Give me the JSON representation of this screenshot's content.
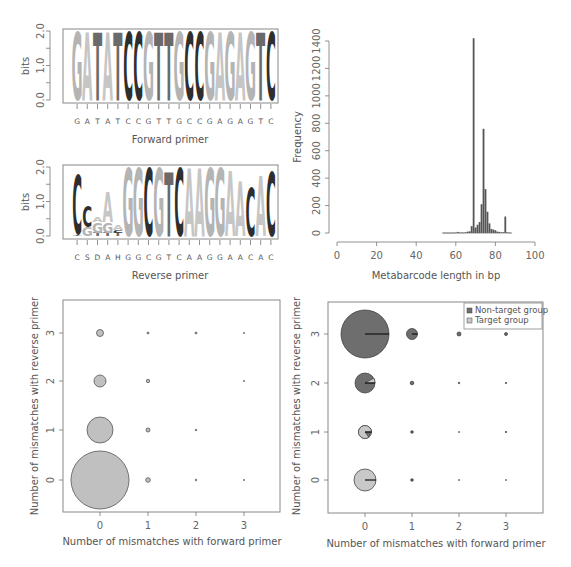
{
  "chart_data": [
    {
      "id": "forward-logo",
      "type": "sequence_logo",
      "ylabel": "bits",
      "xlabel": "Forward primer",
      "ylim": [
        0,
        2.0
      ],
      "yticks": [
        "0.0",
        "1.0",
        "2.0"
      ],
      "sequence": [
        "G",
        "A",
        "T",
        "A",
        "T",
        "C",
        "C",
        "G",
        "T",
        "T",
        "G",
        "C",
        "C",
        "G",
        "A",
        "G",
        "A",
        "G",
        "T",
        "C"
      ],
      "letter_heights": [
        1.95,
        1.95,
        1.95,
        1.95,
        1.95,
        1.95,
        1.95,
        1.95,
        1.95,
        1.95,
        1.95,
        1.95,
        1.95,
        1.95,
        1.95,
        1.95,
        1.95,
        1.95,
        1.95,
        1.95
      ]
    },
    {
      "id": "reverse-logo",
      "type": "sequence_logo",
      "ylabel": "bits",
      "xlabel": "Reverse primer",
      "ylim": [
        0,
        2.0
      ],
      "yticks": [
        "0.0",
        "1.0",
        "2.0"
      ],
      "sequence": [
        "C",
        "S",
        "D",
        "A",
        "H",
        "G",
        "G",
        "C",
        "G",
        "T",
        "C",
        "A",
        "A",
        "G",
        "G",
        "A",
        "A",
        "C",
        "A",
        "C"
      ],
      "stacks": [
        [
          {
            "l": "T",
            "h": 0.05
          },
          {
            "l": "C",
            "h": 1.7
          }
        ],
        [
          {
            "l": "G",
            "h": 0.25
          },
          {
            "l": "C",
            "h": 0.6
          }
        ],
        [
          {
            "l": "T",
            "h": 0.1
          },
          {
            "l": "G",
            "h": 0.3
          },
          {
            "l": "A",
            "h": 0.15
          }
        ],
        [
          {
            "l": "T",
            "h": 0.1
          },
          {
            "l": "G",
            "h": 0.3
          },
          {
            "l": "A",
            "h": 0.85
          }
        ],
        [
          {
            "l": "T",
            "h": 0.1
          },
          {
            "l": "C",
            "h": 0.08
          },
          {
            "l": "A",
            "h": 0.15
          }
        ],
        [
          {
            "l": "G",
            "h": 1.95
          }
        ],
        [
          {
            "l": "G",
            "h": 1.95
          }
        ],
        [
          {
            "l": "C",
            "h": 1.95
          }
        ],
        [
          {
            "l": "G",
            "h": 1.95
          }
        ],
        [
          {
            "l": "T",
            "h": 1.85
          }
        ],
        [
          {
            "l": "C",
            "h": 1.95
          }
        ],
        [
          {
            "l": "A",
            "h": 1.95
          }
        ],
        [
          {
            "l": "A",
            "h": 1.95
          }
        ],
        [
          {
            "l": "G",
            "h": 1.95
          }
        ],
        [
          {
            "l": "G",
            "h": 1.95
          }
        ],
        [
          {
            "l": "A",
            "h": 1.9
          }
        ],
        [
          {
            "l": "A",
            "h": 1.6
          }
        ],
        [
          {
            "l": "C",
            "h": 1.4
          }
        ],
        [
          {
            "l": "A",
            "h": 1.75
          }
        ],
        [
          {
            "l": "C",
            "h": 1.85
          }
        ]
      ]
    },
    {
      "id": "length-histogram",
      "type": "bar",
      "xlabel": "Metabarcode length in bp",
      "ylabel": "Frequency",
      "xlim": [
        0,
        100
      ],
      "ylim": [
        0,
        1400
      ],
      "xticks": [
        "0",
        "20",
        "40",
        "60",
        "80",
        "100"
      ],
      "yticks": [
        "0",
        "200",
        "400",
        "600",
        "800",
        "1000",
        "1200",
        "1400"
      ],
      "x": [
        54,
        55,
        56,
        57,
        58,
        59,
        60,
        61,
        62,
        63,
        64,
        65,
        66,
        67,
        68,
        69,
        70,
        71,
        72,
        73,
        74,
        75,
        76,
        77,
        78,
        79,
        80,
        81,
        82,
        83,
        84,
        85,
        86,
        87,
        88
      ],
      "values": [
        2,
        2,
        2,
        2,
        2,
        2,
        3,
        8,
        3,
        3,
        3,
        5,
        10,
        12,
        50,
        1420,
        40,
        60,
        80,
        210,
        760,
        320,
        155,
        70,
        30,
        25,
        20,
        10,
        8,
        5,
        5,
        120,
        5,
        3,
        2
      ]
    },
    {
      "id": "mismatch-bubble-all",
      "type": "scatter",
      "xlabel": "Number of mismatches with forward primer",
      "ylabel": "Number of mismatches with reverse primer",
      "xticks": [
        "0",
        "1",
        "2",
        "3"
      ],
      "yticks": [
        "0",
        "1",
        "2",
        "3"
      ],
      "points": [
        {
          "x": 0,
          "y": 0,
          "r": 29
        },
        {
          "x": 0,
          "y": 1,
          "r": 13
        },
        {
          "x": 0,
          "y": 2,
          "r": 6
        },
        {
          "x": 0,
          "y": 3,
          "r": 3.5
        },
        {
          "x": 1,
          "y": 0,
          "r": 2.3
        },
        {
          "x": 1,
          "y": 1,
          "r": 2
        },
        {
          "x": 1,
          "y": 2,
          "r": 1.7
        },
        {
          "x": 1,
          "y": 3,
          "r": 1
        },
        {
          "x": 2,
          "y": 0,
          "r": 0.8
        },
        {
          "x": 2,
          "y": 1,
          "r": 0.8
        },
        {
          "x": 2,
          "y": 3,
          "r": 1
        },
        {
          "x": 3,
          "y": 0,
          "r": 0.6
        },
        {
          "x": 3,
          "y": 2,
          "r": 0.6
        },
        {
          "x": 3,
          "y": 3,
          "r": 0.6
        }
      ]
    },
    {
      "id": "mismatch-pie-groups",
      "type": "scatter",
      "xlabel": "Number of mismatches with forward primer",
      "ylabel": "Number of mismatches with reverse primer",
      "xticks": [
        "0",
        "1",
        "2",
        "3"
      ],
      "yticks": [
        "0",
        "1",
        "2",
        "3"
      ],
      "legend": [
        {
          "label": "Non-target group",
          "color": "#6e6e6e"
        },
        {
          "label": "Target group",
          "color": "#c8c8c8"
        }
      ],
      "legend_position": "top-right",
      "points": [
        {
          "x": 0,
          "y": 3,
          "r": 24,
          "target_frac": 0.0
        },
        {
          "x": 0,
          "y": 2,
          "r": 10,
          "target_frac": 0.08
        },
        {
          "x": 0,
          "y": 1,
          "r": 6.5,
          "target_frac": 0.85
        },
        {
          "x": 0,
          "y": 0,
          "r": 11,
          "target_frac": 1.0
        },
        {
          "x": 1,
          "y": 3,
          "r": 5.5,
          "target_frac": 0.0
        },
        {
          "x": 1,
          "y": 2,
          "r": 1.8,
          "target_frac": 0.0
        },
        {
          "x": 1,
          "y": 1,
          "r": 1.3,
          "target_frac": 0.0
        },
        {
          "x": 1,
          "y": 0,
          "r": 1.3,
          "target_frac": 0.0
        },
        {
          "x": 2,
          "y": 3,
          "r": 2,
          "target_frac": 0.0
        },
        {
          "x": 2,
          "y": 2,
          "r": 0.8,
          "target_frac": 0.0
        },
        {
          "x": 2,
          "y": 1,
          "r": 0.5,
          "target_frac": 0.0
        },
        {
          "x": 2,
          "y": 0,
          "r": 0.5,
          "target_frac": 0.0
        },
        {
          "x": 3,
          "y": 3,
          "r": 1.5,
          "target_frac": 0.0
        },
        {
          "x": 3,
          "y": 2,
          "r": 0.7,
          "target_frac": 0.0
        },
        {
          "x": 3,
          "y": 1,
          "r": 0.7,
          "target_frac": 0.0
        },
        {
          "x": 3,
          "y": 0,
          "r": 0.5,
          "target_frac": 0.0
        }
      ]
    }
  ],
  "labels": {
    "bits": "bits",
    "forward_primer": "Forward primer",
    "reverse_primer": "Reverse primer",
    "frequency": "Frequency",
    "length": "Metabarcode length in bp",
    "x_mismatch": "Number of mismatches with forward primer",
    "y_mismatch": "Number of mismatches with reverse primer",
    "legend_nontarget": "Non-target group",
    "legend_target": "Target group"
  },
  "colors": {
    "G": "#b4b4b4",
    "A": "#c6c6c6",
    "T": "#6a6a6a",
    "C": "#2e2e2e",
    "nontarget": "#6e6e6e",
    "target": "#c8c8c8",
    "axis": "#777777"
  }
}
